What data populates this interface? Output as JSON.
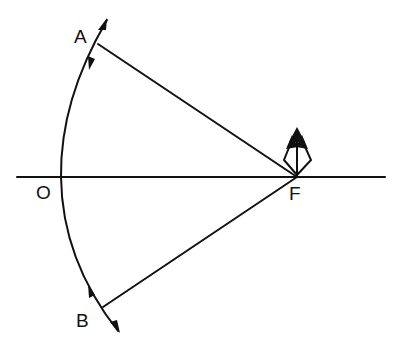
{
  "diagram": {
    "type": "optics-mirror-focus",
    "labels": {
      "A": "A",
      "B": "B",
      "O": "O",
      "F": "F"
    },
    "points": {
      "A": [
        98,
        44
      ],
      "O": [
        61,
        177
      ],
      "B": [
        103,
        307
      ],
      "F": [
        297,
        177
      ]
    },
    "axis": {
      "from": [
        17,
        177
      ],
      "to": [
        385,
        177
      ]
    },
    "colors": {
      "ink": "#111111",
      "background": "#ffffff"
    }
  }
}
